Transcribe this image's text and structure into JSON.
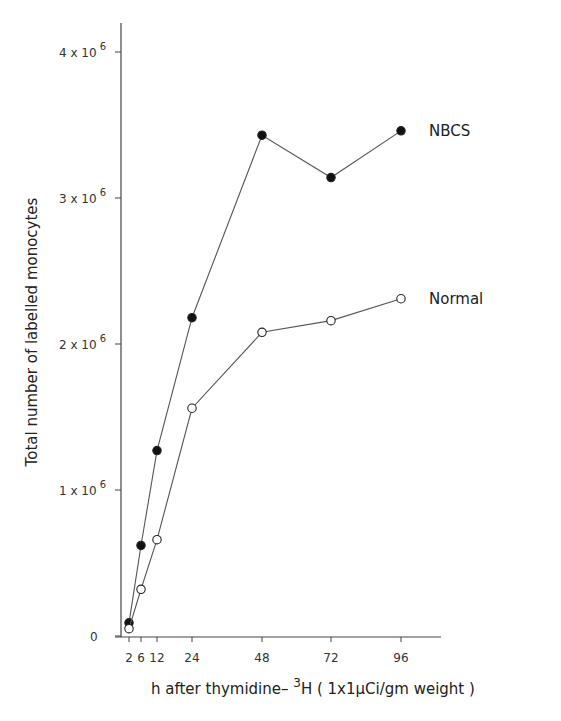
{
  "chart_data": {
    "type": "line",
    "title": "",
    "xlabel": "h after thymidine-³H (1x1µCi/gm weight)",
    "xlabel_parts": {
      "pre": "h after thymidine– ",
      "sup": "3",
      "post": "H ( 1x1µCi/gm weight )"
    },
    "ylabel": "Total number of labelled monocytes",
    "x": [
      2,
      6,
      12,
      24,
      48,
      72,
      96
    ],
    "x_tick_labels": [
      "2",
      "6",
      "12",
      "24",
      "48",
      "72",
      "96"
    ],
    "y_ticks": [
      {
        "value": 0,
        "label": "0",
        "exp": ""
      },
      {
        "value": 1000000,
        "label": "1 x 10",
        "exp": "6"
      },
      {
        "value": 2000000,
        "label": "2 x 10",
        "exp": "6"
      },
      {
        "value": 3000000,
        "label": "3 x 10",
        "exp": "6"
      },
      {
        "value": 4000000,
        "label": "4 x 10",
        "exp": "6"
      }
    ],
    "ylim": [
      0,
      4000000
    ],
    "xlim": [
      0,
      108
    ],
    "grid": false,
    "legend_position": "inline-right",
    "series": [
      {
        "name": "NBCS",
        "marker": "filled-circle",
        "values": [
          90000,
          620000,
          1270000,
          2180000,
          3430000,
          3140000,
          3460000
        ]
      },
      {
        "name": "Normal",
        "marker": "open-circle",
        "values": [
          50000,
          320000,
          660000,
          1560000,
          2080000,
          2160000,
          2310000
        ]
      }
    ]
  }
}
